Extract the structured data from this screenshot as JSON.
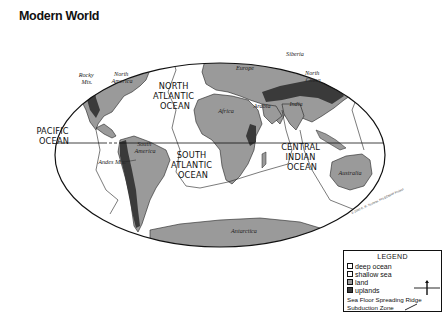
{
  "title": "Modern World",
  "map": {
    "projection": "Mollweide (world)",
    "equator": "dashed over Pacific, solid elsewhere",
    "colors": {
      "deep_ocean": "#ffffff",
      "shallow_sea": "#ffffff",
      "land": "#9a9a9a",
      "uplands": "#3a3a3a",
      "outline": "#111111"
    },
    "ocean_labels": {
      "north_atlantic": [
        "NORTH",
        "ATLANTIC",
        "OCEAN"
      ],
      "pacific": [
        "PACIFIC",
        "OCEAN"
      ],
      "south_atlantic": [
        "SOUTH",
        "ATLANTIC",
        "OCEAN"
      ],
      "central_indian": [
        "CENTRAL",
        "INDIAN",
        "OCEAN"
      ]
    },
    "land_labels": {
      "rocky": [
        "Rocky",
        "Mts."
      ],
      "north_america": [
        "North",
        "America"
      ],
      "europe": "Europe",
      "siberia": "Siberia",
      "north_china": [
        "North",
        "China"
      ],
      "africa": "Africa",
      "arabia": "Arabia",
      "india": "India",
      "south_america": [
        "South",
        "America"
      ],
      "andes": "Andes Mts.",
      "australia": "Australia",
      "antarctica": "Antarctica"
    },
    "credit": "© 2000 C. R. Scotese, PALEOMAP Project"
  },
  "legend": {
    "title": "LEGEND",
    "items": [
      {
        "label": "deep ocean",
        "swatch": "deep"
      },
      {
        "label": "shallow sea",
        "swatch": "shallow"
      },
      {
        "label": "land",
        "swatch": "land"
      },
      {
        "label": "uplands",
        "swatch": "uplands"
      }
    ],
    "ridge_label": "Sea Floor Spreading Ridge",
    "subduction_label": "Subduction Zone"
  }
}
